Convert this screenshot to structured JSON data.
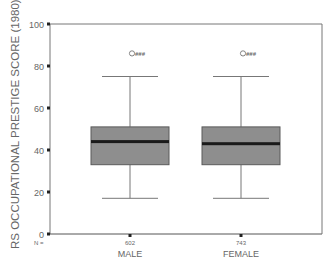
{
  "chart_data": {
    "type": "boxplot",
    "title": "",
    "xlabel": "",
    "ylabel": "RS OCCUPATIONAL PRESTIGE SCORE (1980)",
    "ylim": [
      0,
      100
    ],
    "yticks": [
      0,
      20,
      40,
      60,
      80,
      100
    ],
    "categories": [
      "MALE",
      "FEMALE"
    ],
    "n_label": "N =",
    "n": [
      602,
      743
    ],
    "boxes": [
      {
        "name": "MALE",
        "min": 17,
        "q1": 33,
        "median": 44,
        "q3": 51,
        "max": 75,
        "outliers": [
          86
        ],
        "outlier_label": "###"
      },
      {
        "name": "FEMALE",
        "min": 17,
        "q1": 33,
        "median": 43,
        "q3": 51,
        "max": 75,
        "outliers": [
          86
        ],
        "outlier_label": "###"
      }
    ],
    "grid": false,
    "legend": null,
    "colors": {
      "box_fill": "#8e8e8e",
      "box_edge": "#5a5a5a",
      "median": "#1a1a1a",
      "whisker": "#777777",
      "axis": "#777777"
    }
  }
}
